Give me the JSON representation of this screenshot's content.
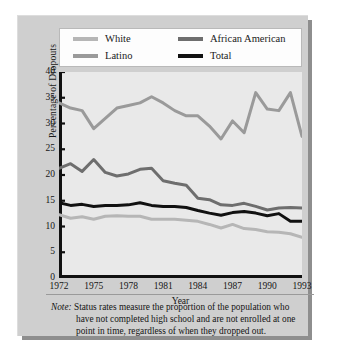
{
  "figure": {
    "background": "#ffffff",
    "panel_color": "#cfcfcf",
    "plot_background": "#e9e9e9"
  },
  "legend": {
    "items": [
      {
        "label": "White",
        "color": "#b6b6b6",
        "column": 1
      },
      {
        "label": "African American",
        "color": "#6e6e6e",
        "column": 2
      },
      {
        "label": "Latino",
        "color": "#9a9a9a",
        "column": 1
      },
      {
        "label": "Total",
        "color": "#111111",
        "column": 2
      }
    ]
  },
  "note": {
    "lead": "Note:",
    "line1": " Status rates measure the proportion of the population who",
    "line2": "have not completed high school and are not enrolled at one",
    "line3": "point in time, regardless of when they dropped out."
  },
  "chart_data": {
    "type": "line",
    "title": "",
    "xlabel": "Year",
    "ylabel": "Percentage of Dropouts",
    "xlim": [
      1972,
      1993
    ],
    "ylim": [
      0,
      40
    ],
    "yticks": [
      0,
      5,
      10,
      15,
      20,
      25,
      30,
      35,
      40
    ],
    "xticks": [
      1972,
      1975,
      1978,
      1981,
      1984,
      1987,
      1990,
      1993
    ],
    "grid": false,
    "legend_position": "top",
    "x": [
      1972,
      1973,
      1974,
      1975,
      1976,
      1977,
      1978,
      1979,
      1980,
      1981,
      1982,
      1983,
      1984,
      1985,
      1986,
      1987,
      1988,
      1989,
      1990,
      1991,
      1992,
      1993
    ],
    "series": [
      {
        "name": "Latino",
        "color": "#9a9a9a",
        "width": 3.0,
        "values": [
          34.0,
          33.0,
          32.5,
          29.0,
          31.0,
          33.0,
          33.5,
          34.0,
          35.2,
          34.0,
          32.5,
          31.5,
          31.5,
          29.5,
          27.0,
          30.5,
          28.2,
          36.0,
          32.8,
          32.5,
          36.0,
          27.5
        ]
      },
      {
        "name": "African American",
        "color": "#6e6e6e",
        "width": 3.0,
        "values": [
          21.3,
          22.2,
          20.7,
          23.0,
          20.5,
          19.8,
          20.2,
          21.1,
          21.3,
          18.9,
          18.4,
          18.0,
          15.5,
          15.2,
          14.2,
          14.1,
          14.5,
          13.9,
          13.2,
          13.6,
          13.7,
          13.6
        ]
      },
      {
        "name": "Total",
        "color": "#111111",
        "width": 3.0,
        "values": [
          14.6,
          14.1,
          14.3,
          13.9,
          14.1,
          14.1,
          14.2,
          14.6,
          14.1,
          13.9,
          13.9,
          13.7,
          13.1,
          12.6,
          12.2,
          12.7,
          12.9,
          12.6,
          12.1,
          12.5,
          11.0,
          11.0
        ]
      },
      {
        "name": "White",
        "color": "#b6b6b6",
        "width": 3.0,
        "values": [
          12.3,
          11.6,
          11.9,
          11.4,
          12.0,
          12.1,
          12.0,
          12.0,
          11.4,
          11.4,
          11.4,
          11.2,
          11.0,
          10.4,
          9.7,
          10.4,
          9.6,
          9.4,
          9.0,
          8.9,
          8.6,
          7.9
        ]
      }
    ]
  }
}
